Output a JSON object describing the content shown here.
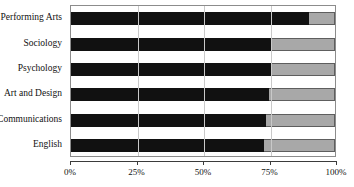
{
  "top_clipped_text": "",
  "axis": {
    "x_ticks": [
      "0%",
      "25%",
      "50%",
      "75%",
      "100%"
    ],
    "x_tick_values": [
      0,
      25,
      50,
      75,
      100
    ]
  },
  "colors": {
    "primary": "#111111",
    "secondary": "#a8a8a8",
    "gridline": "#c9c9c9",
    "frame": "#8c8c8c",
    "axis": "#3b3b3b",
    "background": "#ffffff"
  },
  "chart_data": {
    "type": "bar",
    "orientation": "horizontal",
    "stacked": true,
    "normalized_percent": true,
    "title": "",
    "subtitle": "",
    "xlabel": "",
    "ylabel": "",
    "xlim": [
      0,
      100
    ],
    "grid": true,
    "legend_position": "none",
    "categories": [
      "Performing Arts",
      "Sociology",
      "Psychology",
      "Art and Design",
      "Communications",
      "English"
    ],
    "series": [
      {
        "name": "primary",
        "color": "#111111",
        "values": [
          90,
          76,
          76,
          75,
          74,
          73
        ]
      },
      {
        "name": "secondary",
        "color": "#a8a8a8",
        "values": [
          10,
          24,
          24,
          25,
          26,
          27
        ]
      }
    ],
    "tick_labels": [
      "0%",
      "25%",
      "50%",
      "75%",
      "100%"
    ]
  }
}
